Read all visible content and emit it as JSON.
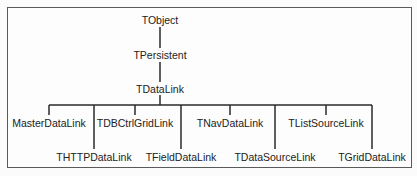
{
  "diagram": {
    "type": "class-hierarchy",
    "nodes": [
      {
        "id": "tobject",
        "label": "TObject"
      },
      {
        "id": "tpersistent",
        "label": "TPersistent"
      },
      {
        "id": "tdatalink",
        "label": "TDataLink"
      },
      {
        "id": "masterdatalink",
        "label": "MasterDataLink"
      },
      {
        "id": "thttpdatalink",
        "label": "THTTPDataLink"
      },
      {
        "id": "tdbctrlgridlink",
        "label": "TDBCtrlGridLink"
      },
      {
        "id": "tfielddatalink",
        "label": "TFieldDataLink"
      },
      {
        "id": "tnavdatalink",
        "label": "TNavDataLink"
      },
      {
        "id": "tdatasourcelink",
        "label": "TDataSourceLink"
      },
      {
        "id": "tlistsourcelink",
        "label": "TListSourceLink"
      },
      {
        "id": "tgriddatalink",
        "label": "TGridDataLink"
      }
    ],
    "edges": [
      {
        "from": "tobject",
        "to": "tpersistent"
      },
      {
        "from": "tpersistent",
        "to": "tdatalink"
      },
      {
        "from": "tdatalink",
        "to": "masterdatalink"
      },
      {
        "from": "tdatalink",
        "to": "thttpdatalink"
      },
      {
        "from": "tdatalink",
        "to": "tdbctrlgridlink"
      },
      {
        "from": "tdatalink",
        "to": "tfielddatalink"
      },
      {
        "from": "tdatalink",
        "to": "tnavdatalink"
      },
      {
        "from": "tdatalink",
        "to": "tdatasourcelink"
      },
      {
        "from": "tdatalink",
        "to": "tlistsourcelink"
      },
      {
        "from": "tdatalink",
        "to": "tgriddatalink"
      }
    ]
  }
}
